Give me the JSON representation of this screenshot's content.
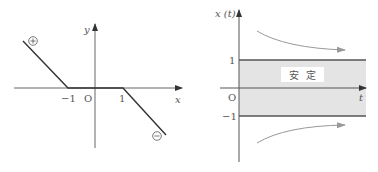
{
  "left_plot": {
    "x_axis_label": "x",
    "y_axis_label": "y",
    "origin_label": "O",
    "tick_neg1": "−1",
    "tick_pos1": "1",
    "plus_marker": "+",
    "minus_marker": "−"
  },
  "right_plot": {
    "y_axis_label": "x (t)",
    "t_axis_label": "t",
    "origin_label": "O",
    "tick_pos1": "1",
    "tick_neg1": "−1",
    "band_label": "安  定",
    "band_color": "#e4e4e4",
    "arrow_color": "#999999"
  }
}
